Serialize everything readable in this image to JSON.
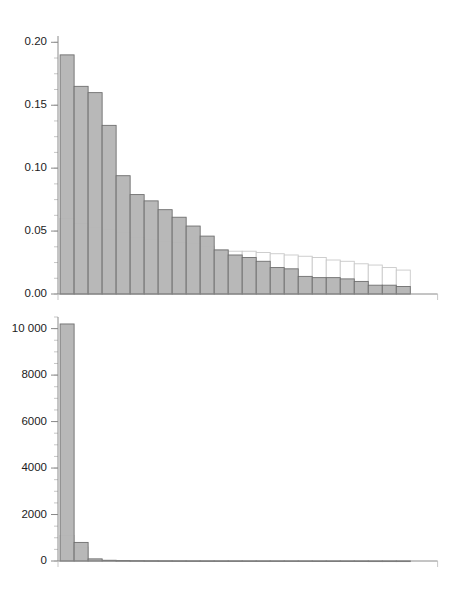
{
  "figure": {
    "title": "",
    "panel_count": 2,
    "background": "#ffffff"
  },
  "colors": {
    "bar_front_fill": "#b5b5b5",
    "bar_front_stroke": "#6f6f6f",
    "bar_back_fill": "#ffffff",
    "bar_back_stroke": "#c9c9c9",
    "axis": "#8a8a8a",
    "text": "#1c1c1c"
  },
  "chart_data": [
    {
      "type": "bar",
      "id": "top-panel",
      "title": "",
      "subtitle": "",
      "xlabel": "",
      "ylabel": "",
      "grid": false,
      "legend": "none",
      "annotations": [],
      "xlim": [
        0,
        26
      ],
      "ylim": [
        0.0,
        0.205
      ],
      "ytick_labels": [
        "0.00",
        "0.05",
        "0.10",
        "0.15",
        "0.20"
      ],
      "ytick_values": [
        0.0,
        0.05,
        0.1,
        0.15,
        0.2
      ],
      "yminor_step": 0.0125,
      "xtick_labels": [],
      "xtick_values": [],
      "categories": [
        1,
        2,
        3,
        4,
        5,
        6,
        7,
        8,
        9,
        10,
        11,
        12,
        13,
        14,
        15,
        16,
        17,
        18,
        19,
        20,
        21,
        22,
        23,
        24,
        25
      ],
      "series": [
        {
          "name": "observed",
          "style": "filled-gray",
          "values": [
            0.19,
            0.165,
            0.16,
            0.134,
            0.094,
            0.079,
            0.074,
            0.067,
            0.061,
            0.054,
            0.046,
            0.035,
            0.031,
            0.029,
            0.026,
            0.021,
            0.02,
            0.014,
            0.013,
            0.013,
            0.012,
            0.01,
            0.007,
            0.007,
            0.006
          ]
        },
        {
          "name": "expected",
          "style": "outlined-white",
          "values": [
            0.06,
            0.056,
            0.053,
            0.051,
            0.049,
            0.045,
            0.043,
            0.042,
            0.041,
            0.04,
            0.038,
            0.035,
            0.034,
            0.034,
            0.033,
            0.032,
            0.031,
            0.03,
            0.029,
            0.027,
            0.026,
            0.024,
            0.023,
            0.021,
            0.019
          ]
        }
      ]
    },
    {
      "type": "bar",
      "id": "bottom-panel",
      "title": "",
      "subtitle": "",
      "xlabel": "",
      "ylabel": "",
      "grid": false,
      "legend": "none",
      "annotations": [],
      "xlim": [
        0,
        26
      ],
      "ylim": [
        0,
        10500
      ],
      "ytick_labels": [
        "0",
        "2000",
        "4000",
        "6000",
        "8000",
        "10 000"
      ],
      "ytick_values": [
        0,
        2000,
        4000,
        6000,
        8000,
        10000
      ],
      "yminor_step": 500,
      "xtick_labels": [],
      "xtick_values": [],
      "categories": [
        1,
        2,
        3,
        4,
        5,
        6,
        7,
        8,
        9,
        10,
        11,
        12,
        13,
        14,
        15,
        16,
        17,
        18,
        19,
        20,
        21,
        22,
        23,
        24,
        25
      ],
      "series": [
        {
          "name": "observed",
          "style": "filled-gray",
          "values": [
            10200,
            800,
            90,
            30,
            20,
            15,
            12,
            10,
            8,
            7,
            6,
            5,
            5,
            4,
            4,
            3,
            3,
            3,
            2,
            2,
            2,
            2,
            1,
            1,
            1
          ]
        },
        {
          "name": "expected",
          "style": "outlined-white",
          "values": [
            1100,
            600,
            80,
            28,
            18,
            14,
            11,
            9,
            8,
            7,
            6,
            5,
            4,
            4,
            3,
            3,
            3,
            2,
            2,
            2,
            2,
            1,
            1,
            1,
            1
          ]
        }
      ]
    }
  ]
}
